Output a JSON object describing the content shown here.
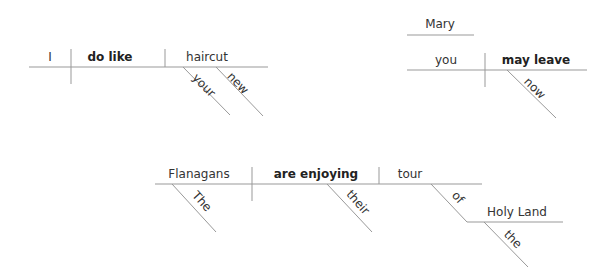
{
  "diagram_title": "Sentence diagrams",
  "colors": {
    "line": "#999999",
    "text": "#333333",
    "verb_text": "#222222",
    "background": "#ffffff"
  },
  "sentences": [
    {
      "id": "s1",
      "subject": "I",
      "verb": "do like",
      "object": "haircut",
      "modifiers": [
        {
          "word": "your",
          "modifies": "haircut"
        },
        {
          "word": "new",
          "modifies": "haircut"
        }
      ]
    },
    {
      "id": "s2",
      "address": "Mary",
      "subject": "you",
      "verb": "may leave",
      "modifiers": [
        {
          "word": "now",
          "modifies": "may leave"
        }
      ]
    },
    {
      "id": "s3",
      "subject": "Flanagans",
      "verb": "are enjoying",
      "object": "tour",
      "modifiers": [
        {
          "word": "The",
          "modifies": "Flanagans"
        },
        {
          "word": "their",
          "modifies": "tour"
        },
        {
          "word": "of",
          "modifies": "tour",
          "type": "preposition"
        },
        {
          "word": "the",
          "modifies": "Holy Land"
        }
      ],
      "prepositional_object": "Holy Land"
    }
  ]
}
